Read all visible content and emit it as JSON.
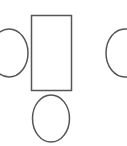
{
  "diagram": {
    "stroke_color": "#555555",
    "background": "#ffffff",
    "shapes": [
      {
        "name": "center-rectangle",
        "type": "rect",
        "x": 31.5,
        "y": 15.5,
        "width": 40,
        "height": 75
      },
      {
        "name": "left-oval",
        "type": "ellipse",
        "cx": 9,
        "cy": 53,
        "rx": 19,
        "ry": 24
      },
      {
        "name": "right-oval",
        "type": "ellipse",
        "cx": 125,
        "cy": 53,
        "rx": 19,
        "ry": 24
      },
      {
        "name": "bottom-oval",
        "type": "ellipse",
        "cx": 51,
        "cy": 118.5,
        "rx": 18.5,
        "ry": 23.5
      }
    ]
  }
}
